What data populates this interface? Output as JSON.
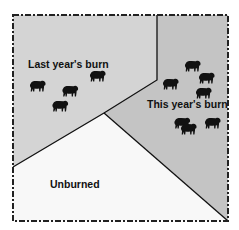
{
  "diagram": {
    "regions": [
      {
        "id": "last-year",
        "label": "Last year's burn",
        "color": "#d4d4d4",
        "cattle_count": 4
      },
      {
        "id": "this-year",
        "label": "This year's burn",
        "color": "#c4c4c4",
        "cattle_count": 7
      },
      {
        "id": "unburned",
        "label": "Unburned",
        "color": "#f8f8f8",
        "cattle_count": 0
      }
    ],
    "colors": {
      "frame": "#222222",
      "divider": "#111111",
      "cattle": "#111111"
    },
    "icon": "cow-icon"
  }
}
